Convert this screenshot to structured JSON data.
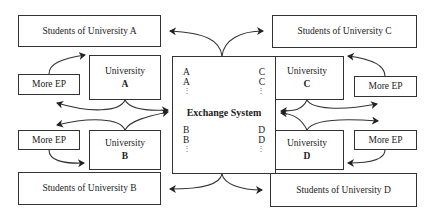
{
  "diagram": {
    "exchange_system": {
      "title": "Exchange System",
      "left_top": [
        "A",
        "A",
        "⋮"
      ],
      "right_top": [
        "C",
        "C",
        "⋮"
      ],
      "left_bottom": [
        "B",
        "B",
        "⋮"
      ],
      "right_bottom": [
        "D",
        "D",
        "⋮"
      ]
    },
    "universities": {
      "a": {
        "label": "University",
        "letter": "A",
        "students": "Students of University A",
        "more": "More EP"
      },
      "b": {
        "label": "University",
        "letter": "B",
        "students": "Students of University B",
        "more": "More EP"
      },
      "c": {
        "label": "University",
        "letter": "C",
        "students": "Students of University C",
        "more": "More EP"
      },
      "d": {
        "label": "University",
        "letter": "D",
        "students": "Students of University D",
        "more": "More EP"
      }
    },
    "colors": {
      "stroke": "#333333",
      "background": "#ffffff"
    }
  }
}
